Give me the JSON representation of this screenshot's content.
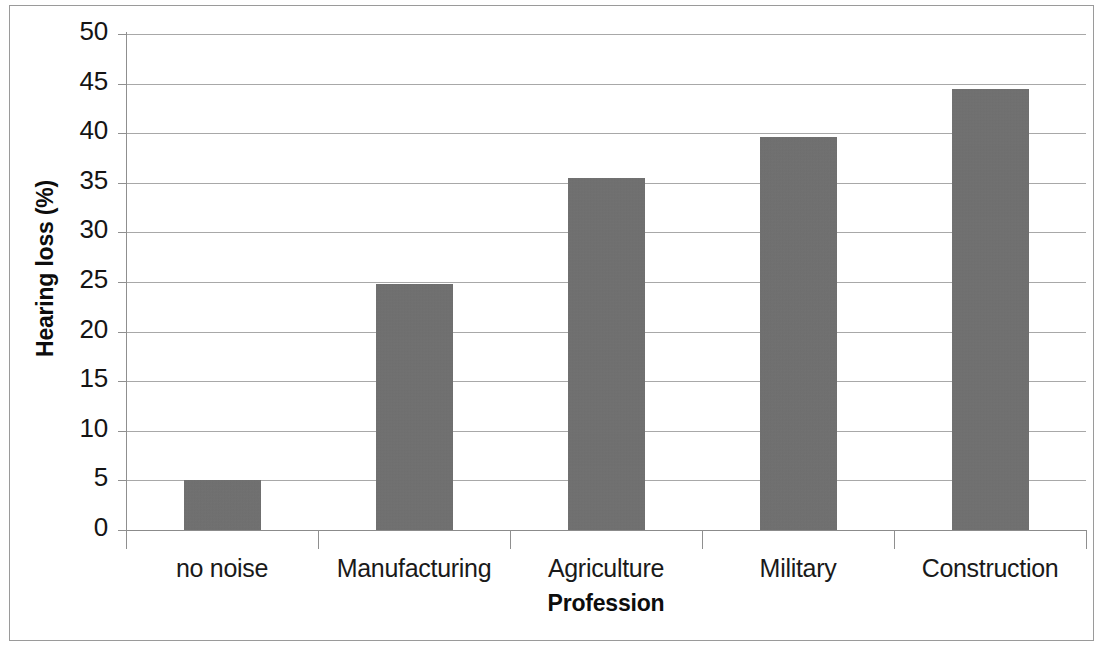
{
  "chart_data": {
    "type": "bar",
    "title": "",
    "xlabel": "Profession",
    "ylabel": "Hearing loss (%)",
    "categories": [
      "no noise",
      "Manufacturing",
      "Agriculture",
      "Military",
      "Construction"
    ],
    "values": [
      5.0,
      24.8,
      35.5,
      39.6,
      44.5
    ],
    "series": [
      {
        "name": "Hearing loss (%)",
        "values": [
          5.0,
          24.8,
          35.5,
          39.6,
          44.5
        ]
      }
    ],
    "ylim": [
      0,
      50
    ],
    "y_ticks": [
      0,
      5,
      10,
      15,
      20,
      25,
      30,
      35,
      40,
      45,
      50
    ],
    "y_tick_labels": [
      "0",
      "5",
      "10",
      "15",
      "20",
      "25",
      "30",
      "35",
      "40",
      "45",
      "50"
    ],
    "grid": true,
    "grid_axis": "y",
    "legend": false,
    "legend_position": "none",
    "bar_color": "#6f6f6f",
    "gridline_color": "#a8a8a8",
    "axis_color": "#8f8f8f",
    "background_color": "#ffffff",
    "frame_border_color": "#9a9a9a"
  }
}
